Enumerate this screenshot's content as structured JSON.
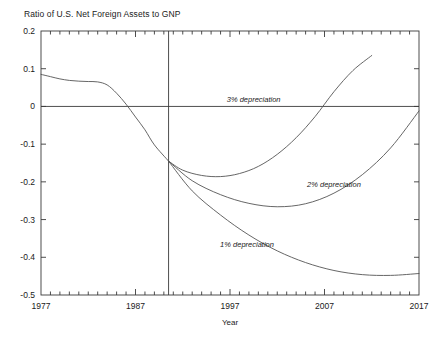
{
  "chart_data": {
    "type": "line",
    "title": "Ratio of U.S. Net Foreign Assets to GNP",
    "xlabel": "Year",
    "ylabel": "",
    "xlim": [
      1977,
      2017
    ],
    "ylim": [
      -0.5,
      0.2
    ],
    "grid": false,
    "legend_position": "inline-annotations",
    "x_ticks": [
      1977,
      1987,
      1997,
      2007,
      2017
    ],
    "x_tick_labels": [
      "1977",
      "1987",
      "1997",
      "2007",
      "2017"
    ],
    "x_minor_tick_step": 1,
    "y_ticks": [
      0.2,
      0.1,
      0,
      -0.1,
      -0.2,
      -0.3,
      -0.4,
      -0.5
    ],
    "y_tick_labels": [
      "0.2",
      "0.1",
      "0",
      "-0.1",
      "-0.2",
      "-0.3",
      "-0.4",
      "-0.5"
    ],
    "zero_line": 0,
    "forecast_divider_x": 1990.5,
    "line_color": "#555555",
    "axis_color": "#3a3a3a",
    "annotations": [
      {
        "text": "3% depreciation",
        "x": 1999.5,
        "y": 0.0125
      },
      {
        "text": "2% depreciation",
        "x": 2008.0,
        "y": -0.2125
      },
      {
        "text": "1% depreciation",
        "x": 1998.8,
        "y": -0.3725
      }
    ],
    "series": [
      {
        "name": "historical",
        "x": [
          1977,
          1978,
          1979,
          1980,
          1981,
          1982,
          1983,
          1984,
          1985,
          1986,
          1987,
          1988,
          1989,
          1990.5
        ],
        "values": [
          0.085,
          0.079,
          0.073,
          0.069,
          0.067,
          0.066,
          0.065,
          0.057,
          0.035,
          0.006,
          -0.028,
          -0.062,
          -0.102,
          -0.145
        ]
      },
      {
        "name": "3% depreciation",
        "x": [
          1990.5,
          1992,
          1994,
          1996,
          1998,
          2000,
          2002,
          2004,
          2006,
          2008,
          2010,
          2012
        ],
        "values": [
          -0.145,
          -0.169,
          -0.183,
          -0.186,
          -0.178,
          -0.159,
          -0.127,
          -0.083,
          -0.027,
          0.039,
          0.095,
          0.135
        ]
      },
      {
        "name": "2% depreciation",
        "x": [
          1990.5,
          1993,
          1996,
          1999,
          2002,
          2005,
          2008,
          2011,
          2014,
          2017
        ],
        "values": [
          -0.145,
          -0.197,
          -0.234,
          -0.257,
          -0.266,
          -0.258,
          -0.23,
          -0.181,
          -0.11,
          -0.012
        ]
      },
      {
        "name": "1% depreciation",
        "x": [
          1990.5,
          1993,
          1996,
          1999,
          2002,
          2005,
          2008,
          2011,
          2014,
          2017
        ],
        "values": [
          -0.145,
          -0.224,
          -0.288,
          -0.341,
          -0.383,
          -0.414,
          -0.435,
          -0.446,
          -0.448,
          -0.443
        ]
      }
    ]
  }
}
